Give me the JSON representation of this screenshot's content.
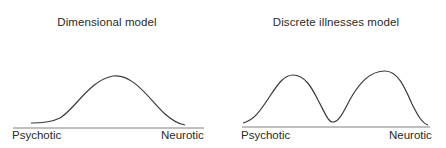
{
  "panels": [
    {
      "title": "Dimensional model",
      "x_left_label": "Psychotic",
      "x_right_label": "Neurotic",
      "curve": "unimodal"
    },
    {
      "title": "Discrete illnesses model",
      "x_left_label": "Psychotic",
      "x_right_label": "Neurotic",
      "curve": "bimodal"
    }
  ],
  "colors": {
    "line": "#3a3a3a",
    "axis": "#7a7a7a",
    "text": "#2a2a2a"
  }
}
